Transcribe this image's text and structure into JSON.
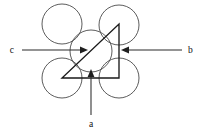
{
  "figure": {
    "background_color": "#ffffff",
    "width": 204,
    "height": 133,
    "colors": {
      "circle_stroke": "#4a4a4a",
      "triangle_stroke": "#1a1a1a",
      "arrow_stroke": "#2b2b2b",
      "arrow_head_fill": "#1f1f1f",
      "label_color": "#101010"
    }
  },
  "circles": [
    {
      "name": "top-left-circle",
      "cx": 62,
      "cy": 24,
      "r": 20
    },
    {
      "name": "top-right-circle",
      "cx": 119,
      "cy": 25,
      "r": 20
    },
    {
      "name": "bottom-left-circle",
      "cx": 62,
      "cy": 78,
      "r": 20
    },
    {
      "name": "bottom-right-circle",
      "cx": 119,
      "cy": 78,
      "r": 20
    },
    {
      "name": "center-circle",
      "cx": 91,
      "cy": 51,
      "r": 21
    }
  ],
  "triangle": {
    "name": "right-triangle",
    "points": "62,78 119,78 119,24",
    "vertices": [
      {
        "label": "bottom-left-vertex",
        "x": 62,
        "y": 78
      },
      {
        "label": "bottom-right-vertex",
        "x": 119,
        "y": 78
      },
      {
        "label": "top-right-vertex",
        "x": 119,
        "y": 24
      }
    ]
  },
  "arrows": [
    {
      "id": "a",
      "label": "a",
      "direction": "up",
      "line": {
        "x1": 91,
        "y1": 115,
        "x2": 91,
        "y2": 72
      },
      "head": "91,69 87.6,77 94.4,77",
      "label_pos": {
        "x": 91,
        "y": 127
      }
    },
    {
      "id": "b",
      "label": "b",
      "direction": "left",
      "line": {
        "x1": 182,
        "y1": 50,
        "x2": 125,
        "y2": 50
      },
      "head": "121,50 129,46.6 129,53.4",
      "label_pos": {
        "x": 188,
        "y": 53
      }
    },
    {
      "id": "c",
      "label": "c",
      "direction": "right",
      "line": {
        "x1": 22,
        "y1": 50,
        "x2": 82,
        "y2": 50
      },
      "head": "88,50 80,46.6 80,53.4",
      "label_pos": {
        "x": 14,
        "y": 53
      }
    }
  ]
}
